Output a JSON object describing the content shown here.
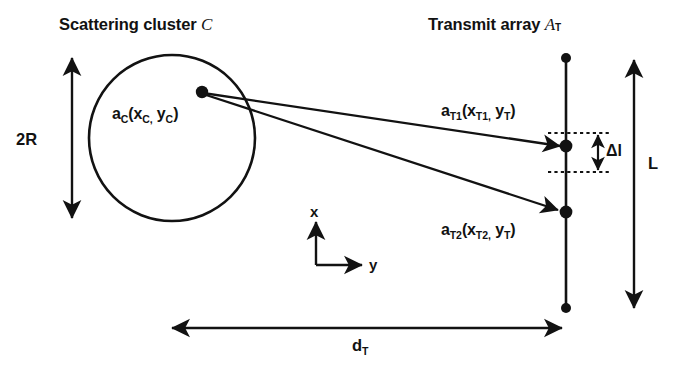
{
  "figure": {
    "background_color": "#ffffff",
    "ink_color": "#121212",
    "titles": {
      "cluster": "Scattering cluster",
      "cluster_symbol": "C",
      "array": "Transmit array",
      "array_symbol": "A",
      "array_symbol_sub": "T"
    },
    "labels": {
      "scatterer": {
        "base": "a",
        "sub": "C",
        "args_open": "(x",
        "args_sub1": "C,",
        "args_mid": " y",
        "args_sub2": "C",
        "args_close": ")"
      },
      "element1": {
        "base": "a",
        "sub": "T1",
        "x_base": "x",
        "x_sub": "T1,",
        "y_base": "y",
        "y_sub": "T"
      },
      "element2": {
        "base": "a",
        "sub": "T2",
        "x_base": "x",
        "x_sub": "T2,",
        "y_base": "y",
        "y_sub": "T"
      },
      "cluster_diameter": "2R",
      "array_length": "L",
      "element_spacing": "Δl",
      "range_base": "d",
      "range_sub": "T",
      "axis_x": "x",
      "axis_y": "y"
    },
    "geometry": {
      "circle": {
        "cx": 172,
        "cy": 138,
        "r": 83
      },
      "scatterer_point": {
        "x": 202,
        "y": 92
      },
      "array_line": {
        "x": 566,
        "y_top": 58,
        "y_bottom": 308
      },
      "element1_point": {
        "x": 566,
        "y": 146
      },
      "element2_point": {
        "x": 566,
        "y": 212
      },
      "diameter_arrow": {
        "x": 72,
        "y_top": 55,
        "y_bottom": 221
      },
      "length_arrow": {
        "x": 634,
        "y_top": 58,
        "y_bottom": 310
      },
      "range_arrow": {
        "y": 328,
        "x_left": 170,
        "x_right": 563
      },
      "axes_origin": {
        "x": 316,
        "y": 265
      },
      "spacing_arrow": {
        "x": 598,
        "y_top": 133,
        "y_bottom": 172
      }
    }
  }
}
